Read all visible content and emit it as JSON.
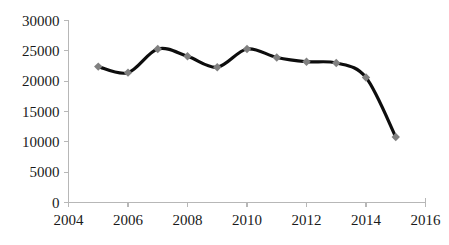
{
  "chart_data": {
    "type": "line",
    "title": "",
    "subtitle": "",
    "xlabel": "",
    "ylabel": "",
    "x": [
      2005,
      2006,
      2007,
      2008,
      2009,
      2010,
      2011,
      2012,
      2013,
      2014,
      2015
    ],
    "values": [
      22400,
      21400,
      25300,
      24100,
      22300,
      25300,
      23900,
      23200,
      23000,
      20600,
      10800
    ],
    "series": [
      {
        "name": "",
        "values": [
          22400,
          21400,
          25300,
          24100,
          22300,
          25300,
          23900,
          23200,
          23000,
          20600,
          10800
        ]
      }
    ],
    "xlim": [
      2004,
      2016
    ],
    "ylim": [
      0,
      30000
    ],
    "x_tick_labels": [
      "2004",
      "2006",
      "2008",
      "2010",
      "2012",
      "2014",
      "2016"
    ],
    "x_tick_values": [
      2004,
      2006,
      2008,
      2010,
      2012,
      2014,
      2016
    ],
    "y_tick_labels": [
      "0",
      "5000",
      "10000",
      "15000",
      "20000",
      "25000",
      "30000"
    ],
    "y_tick_values": [
      0,
      5000,
      10000,
      15000,
      20000,
      25000,
      30000
    ],
    "grid": false,
    "legend": false,
    "legend_position": "none",
    "annotations": [],
    "smoothed": true,
    "marker": "diamond",
    "colors": {
      "line": "#0d0d0d",
      "marker": "#808080",
      "axis": "#b7b7b7",
      "label": "#1a1a1a",
      "background": "#ffffff"
    }
  }
}
